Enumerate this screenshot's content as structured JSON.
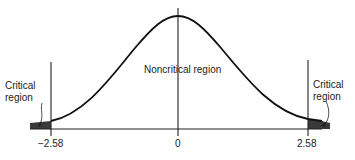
{
  "diagram": {
    "type": "normal-distribution-critical-regions",
    "labels": {
      "critical_left_line1": "Critical",
      "critical_left_line2": "region",
      "critical_right_line1": "Critical",
      "critical_right_line2": "region",
      "noncritical": "Noncritical region"
    },
    "ticks": {
      "left": "−2.58",
      "center": "0",
      "right": "2.58"
    },
    "colors": {
      "curve": "#111111",
      "axis": "#222222",
      "shade": "#3a3a3a"
    }
  }
}
